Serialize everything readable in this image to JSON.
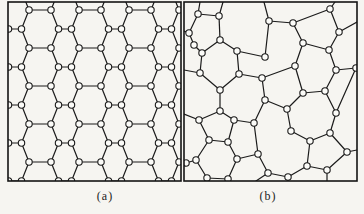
{
  "figure": {
    "background": "#f6f5f1",
    "line_color": "#1b1b1b",
    "node_fill": "#fbfbf8",
    "node_radius": 3.2,
    "panels": [
      {
        "id": "a",
        "label": "(a)",
        "type": "crystalline-honeycomb-network",
        "box": {
          "x": 8,
          "y": 2,
          "width": 173,
          "height": 179
        },
        "lattice": {
          "x0": 21,
          "y0": 8,
          "row_height": 19,
          "period": 50,
          "long_bond": 22,
          "short_bond": 13,
          "diag_dx": 7.5,
          "rows": 10
        }
      },
      {
        "id": "b",
        "label": "(b)",
        "type": "amorphous-random-network",
        "box": {
          "x": 184,
          "y": 2,
          "width": 173,
          "height": 179
        },
        "network": {
          "nodes": {
            "a": [
              14,
              12
            ],
            "b": [
              35,
              14
            ],
            "c": [
              85,
              19
            ],
            "d": [
              146,
              7
            ],
            "e": [
              5,
              31
            ],
            "f": [
              36,
              38
            ],
            "g": [
              10,
              43
            ],
            "h": [
              18,
              51
            ],
            "i": [
              53,
              49
            ],
            "j": [
              81,
              55
            ],
            "k": [
              109,
              21
            ],
            "l": [
              155,
              30
            ],
            "m": [
              119,
              41
            ],
            "n": [
              145,
              48
            ],
            "o": [
              111,
              64
            ],
            "p": [
              16,
              71
            ],
            "q": [
              55,
              72
            ],
            "r": [
              78,
              76
            ],
            "s": [
              172,
              66
            ],
            "t": [
              152,
              68
            ],
            "u": [
              36,
              88
            ],
            "v": [
              81,
              98
            ],
            "w": [
              119,
              91
            ],
            "x": [
              141,
              89
            ],
            "y": [
              36,
              109
            ],
            "z": [
              15,
              118
            ],
            "A": [
              50,
              118
            ],
            "B": [
              70,
              121
            ],
            "C": [
              103,
              107
            ],
            "D": [
              152,
              111
            ],
            "E": [
              25,
              138
            ],
            "F": [
              44,
              140
            ],
            "G": [
              74,
              152
            ],
            "H": [
              12,
              158
            ],
            "I": [
              53,
              157
            ],
            "J": [
              84,
              171
            ],
            "K": [
              2,
              161
            ],
            "L": [
              23,
              176
            ],
            "M": [
              44,
              177
            ],
            "N": [
              107,
              129
            ],
            "O": [
              126,
              139
            ],
            "P": [
              146,
              131
            ],
            "Q": [
              163,
              150
            ],
            "R": [
              123,
              164
            ],
            "S": [
              143,
              168
            ],
            "T": [
              104,
              175
            ]
          },
          "edges": [
            [
              "a",
              "b"
            ],
            [
              "a",
              "e"
            ],
            [
              "b",
              "f"
            ],
            [
              "e",
              "g"
            ],
            [
              "g",
              "h"
            ],
            [
              "f",
              "h"
            ],
            [
              "f",
              "i"
            ],
            [
              "h",
              "p"
            ],
            [
              "c",
              "k"
            ],
            [
              "k",
              "m"
            ],
            [
              "m",
              "o"
            ],
            [
              "c",
              "j"
            ],
            [
              "j",
              "i"
            ],
            [
              "i",
              "q"
            ],
            [
              "q",
              "r"
            ],
            [
              "r",
              "o"
            ],
            [
              "r",
              "v"
            ],
            [
              "o",
              "w"
            ],
            [
              "k",
              "d"
            ],
            [
              "d",
              "l"
            ],
            [
              "l",
              "n"
            ],
            [
              "m",
              "n"
            ],
            [
              "n",
              "t"
            ],
            [
              "t",
              "s"
            ],
            [
              "t",
              "x"
            ],
            [
              "s",
              "D"
            ],
            [
              "w",
              "x"
            ],
            [
              "w",
              "C"
            ],
            [
              "x",
              "D"
            ],
            [
              "p",
              "u"
            ],
            [
              "q",
              "u"
            ],
            [
              "u",
              "y"
            ],
            [
              "y",
              "z"
            ],
            [
              "y",
              "A"
            ],
            [
              "A",
              "B"
            ],
            [
              "A",
              "F"
            ],
            [
              "B",
              "v"
            ],
            [
              "B",
              "G"
            ],
            [
              "v",
              "C"
            ],
            [
              "E",
              "F"
            ],
            [
              "E",
              "H"
            ],
            [
              "E",
              "z"
            ],
            [
              "F",
              "I"
            ],
            [
              "H",
              "K"
            ],
            [
              "H",
              "L"
            ],
            [
              "I",
              "M"
            ],
            [
              "I",
              "G"
            ],
            [
              "L",
              "M"
            ],
            [
              "G",
              "J"
            ],
            [
              "J",
              "T"
            ],
            [
              "T",
              "R"
            ],
            [
              "R",
              "O"
            ],
            [
              "R",
              "S"
            ],
            [
              "N",
              "C"
            ],
            [
              "N",
              "O"
            ],
            [
              "O",
              "P"
            ],
            [
              "P",
              "D"
            ],
            [
              "P",
              "Q"
            ],
            [
              "Q",
              "S"
            ]
          ],
          "border_stubs": [
            [
              "a",
              [
                16,
                0
              ]
            ],
            [
              "b",
              [
                39,
                0
              ]
            ],
            [
              "c",
              [
                80,
                0
              ]
            ],
            [
              "d",
              [
                151,
                0
              ]
            ],
            [
              "l",
              [
                173,
                20
              ]
            ],
            [
              "Q",
              [
                173,
                148
              ]
            ],
            [
              "e",
              [
                0,
                29
              ]
            ],
            [
              "p",
              [
                0,
                68
              ]
            ],
            [
              "z",
              [
                0,
                112
              ]
            ],
            [
              "J",
              [
                72,
                179
              ]
            ],
            [
              "S",
              [
                143,
                179
              ]
            ],
            [
              "T",
              [
                104,
                179
              ]
            ],
            [
              "M",
              [
                44,
                179
              ]
            ]
          ]
        }
      }
    ]
  }
}
